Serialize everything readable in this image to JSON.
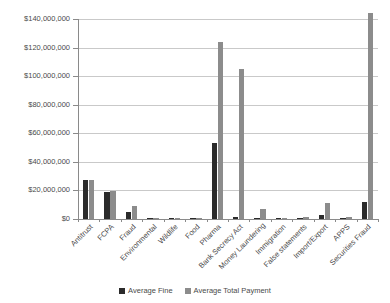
{
  "chart_data": {
    "type": "bar",
    "title": "",
    "subtitle": "",
    "xlabel": "",
    "ylabel": "",
    "ylim": [
      0,
      140000000
    ],
    "ytick_step": 20000000,
    "grid": true,
    "legend_position": "bottom",
    "categories": [
      "Antitrust",
      "FCPA",
      "Fraud",
      "Environmental",
      "Wildlife",
      "Food",
      "Pharma",
      "Bank Secrecy Act",
      "Money Laundering",
      "Immigration",
      "False statements",
      "Import/Export",
      "APPS",
      "Securities Fraud"
    ],
    "ytick_labels": [
      "$0",
      "$20,000,000",
      "$40,000,000",
      "$60,000,000",
      "$80,000,000",
      "$100,000,000",
      "$120,000,000",
      "$140,000,000"
    ],
    "series": [
      {
        "name": "Average Fine",
        "color": "#2b2b2b",
        "values": [
          27000000,
          19000000,
          5000000,
          700000,
          150000,
          400000,
          53000000,
          1200000,
          300000,
          500000,
          900000,
          3000000,
          600000,
          12000000
        ]
      },
      {
        "name": "Average Total Payment",
        "color": "#8c8c8c",
        "values": [
          27000000,
          19500000,
          9000000,
          1000000,
          200000,
          800000,
          124000000,
          105000000,
          7000000,
          900000,
          1600000,
          11000000,
          1200000,
          144000000
        ]
      }
    ]
  },
  "legend": {
    "items": [
      {
        "label": "Average Fine",
        "color": "#2b2b2b"
      },
      {
        "label": "Average Total Payment",
        "color": "#8c8c8c"
      }
    ]
  }
}
